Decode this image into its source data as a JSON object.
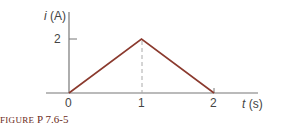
{
  "chart_data": {
    "type": "line",
    "title": "",
    "xlabel": "t (s)",
    "ylabel": "i (A)",
    "x": [
      0,
      1,
      2
    ],
    "series": [
      {
        "name": "i(t)",
        "values": [
          0,
          2,
          0
        ]
      }
    ],
    "x_ticks": [
      "0",
      "1",
      "2"
    ],
    "y_ticks": [
      "2"
    ],
    "xlim": [
      0,
      2
    ],
    "ylim": [
      0,
      2
    ],
    "grid": false,
    "annotations": [
      "dashed vertical line at t = 1 from peak to axis"
    ],
    "line_color": "#8b3a2e",
    "axis_color": "#777777"
  },
  "labels": {
    "y_axis_var": "i",
    "y_axis_unit": "(A)",
    "x_axis_var": "t",
    "x_axis_unit": "(s)",
    "y_tick_2": "2",
    "x_tick_0": "0",
    "x_tick_1": "1",
    "x_tick_2": "2"
  },
  "caption": {
    "prefix": "FIGURE",
    "number": "P 7.6-5"
  }
}
